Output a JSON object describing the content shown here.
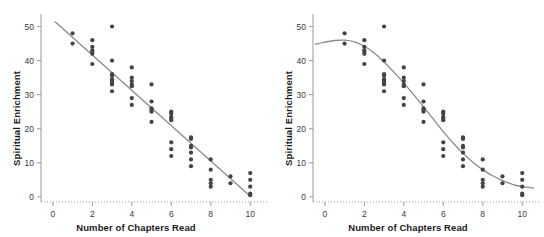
{
  "figure": {
    "background": "#ffffff",
    "point_color": "#43434b",
    "line_color": "#8a8a8a",
    "axis_color": "#9a9a9a",
    "text_color": "#1b1b1b"
  },
  "chart_data": [
    {
      "type": "scatter",
      "title": "",
      "panel": "left",
      "xlabel": "Number of Chapters Read",
      "ylabel": "Spiritual Enrichment",
      "xlim": [
        -0.6,
        10.8
      ],
      "ylim": [
        -1.5,
        52.5
      ],
      "xticks": [
        0,
        2,
        4,
        6,
        8,
        10
      ],
      "xticklabels": [
        "0",
        "2",
        "4",
        "6",
        "8",
        "10"
      ],
      "yticks": [
        0,
        10,
        20,
        30,
        40,
        50
      ],
      "yticklabels": [
        "0",
        "10",
        "20",
        "30",
        "40",
        "50"
      ],
      "grid": false,
      "legend": null,
      "fit": {
        "kind": "line",
        "label": "linear fit",
        "points": [
          [
            0.1,
            51.5
          ],
          [
            10.0,
            0.2
          ]
        ]
      },
      "x": [
        1,
        1,
        2,
        2,
        2,
        2,
        2,
        2,
        3,
        3,
        3,
        3,
        3,
        3,
        3,
        3,
        3,
        4,
        4,
        4,
        4,
        4,
        4,
        4,
        5,
        5,
        5,
        5,
        5,
        5,
        6,
        6,
        6,
        6,
        6,
        6,
        6,
        6,
        7,
        7,
        7,
        7,
        7,
        7,
        7,
        8,
        8,
        8,
        8,
        8,
        9,
        9,
        10,
        10,
        10,
        10,
        10
      ],
      "y": [
        48,
        45,
        46,
        44,
        43,
        42.5,
        42,
        39,
        50,
        40,
        36,
        35.5,
        34.5,
        34,
        33.5,
        33,
        31,
        38,
        35,
        34,
        33,
        32.5,
        29,
        27,
        33,
        28,
        26,
        25.5,
        25,
        22,
        25,
        24.5,
        23.5,
        23,
        22.5,
        16,
        14,
        12,
        17.5,
        17,
        15,
        14.5,
        13,
        11,
        9,
        11,
        8,
        5,
        4,
        3,
        6,
        4,
        7,
        5,
        3,
        1,
        0.5
      ]
    },
    {
      "type": "scatter",
      "title": "",
      "panel": "right",
      "xlabel": "Number of Chapters Read",
      "ylabel": "Spiritual Enrichment",
      "xlim": [
        -0.6,
        10.8
      ],
      "ylim": [
        -1.5,
        52.5
      ],
      "xticks": [
        0,
        2,
        4,
        6,
        8,
        10
      ],
      "xticklabels": [
        "0",
        "2",
        "4",
        "6",
        "8",
        "10"
      ],
      "yticks": [
        0,
        10,
        20,
        30,
        40,
        50
      ],
      "yticklabels": [
        "0",
        "10",
        "20",
        "30",
        "40",
        "50"
      ],
      "grid": false,
      "legend": null,
      "fit": {
        "kind": "curve",
        "label": "smoothed / logistic fit",
        "points": [
          [
            -0.5,
            44.8
          ],
          [
            0.0,
            45.4
          ],
          [
            0.5,
            45.9
          ],
          [
            1.0,
            46.0
          ],
          [
            1.5,
            45.5
          ],
          [
            2.0,
            44.2
          ],
          [
            2.5,
            42.2
          ],
          [
            3.0,
            39.6
          ],
          [
            3.5,
            36.6
          ],
          [
            4.0,
            33.4
          ],
          [
            4.5,
            30.0
          ],
          [
            5.0,
            26.4
          ],
          [
            5.5,
            22.8
          ],
          [
            6.0,
            19.2
          ],
          [
            6.5,
            15.8
          ],
          [
            7.0,
            12.8
          ],
          [
            7.5,
            10.2
          ],
          [
            8.0,
            8.0
          ],
          [
            8.5,
            6.2
          ],
          [
            9.0,
            4.8
          ],
          [
            9.5,
            3.7
          ],
          [
            10.0,
            3.0
          ],
          [
            10.6,
            2.6
          ]
        ]
      },
      "x": [
        1,
        1,
        2,
        2,
        2,
        2,
        2,
        2,
        3,
        3,
        3,
        3,
        3,
        3,
        3,
        3,
        3,
        4,
        4,
        4,
        4,
        4,
        4,
        4,
        5,
        5,
        5,
        5,
        5,
        5,
        6,
        6,
        6,
        6,
        6,
        6,
        6,
        6,
        7,
        7,
        7,
        7,
        7,
        7,
        7,
        8,
        8,
        8,
        8,
        8,
        9,
        9,
        10,
        10,
        10,
        10,
        10
      ],
      "y": [
        48,
        45,
        46,
        44,
        43,
        42.5,
        42,
        39,
        50,
        40,
        36,
        35.5,
        34.5,
        34,
        33.5,
        33,
        31,
        38,
        35,
        34,
        33,
        32.5,
        29,
        27,
        33,
        28,
        26,
        25.5,
        25,
        22,
        25,
        24.5,
        23.5,
        23,
        22.5,
        16,
        14,
        12,
        17.5,
        17,
        15,
        14.5,
        13,
        11,
        9,
        11,
        8,
        5,
        4,
        3,
        6,
        4,
        7,
        5,
        3,
        1,
        0.5
      ]
    }
  ]
}
